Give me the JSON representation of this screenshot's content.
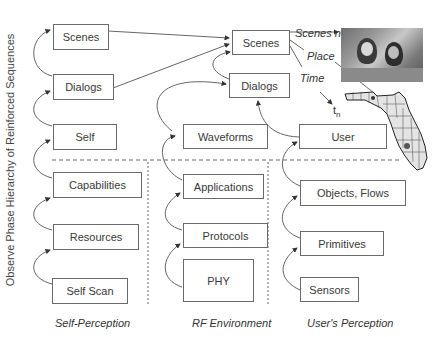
{
  "y_axis_label": "Observe Phase Hierarchy of Reinforced Sequences",
  "columns": [
    {
      "label": "Self-Perception",
      "boxes": [
        "Self Scan",
        "Resources",
        "Capabilities",
        "Self",
        "Dialogs",
        "Scenes"
      ]
    },
    {
      "label": "RF Environment",
      "boxes": [
        "PHY",
        "Protocols",
        "Applications",
        "Waveforms"
      ]
    },
    {
      "label": "User's Perception",
      "boxes": [
        "Sensors",
        "Primitives",
        "Objects, Flows",
        "User"
      ]
    }
  ],
  "shared": {
    "scenes": "Scenes",
    "dialogs": "Dialogs"
  },
  "annotations": {
    "scenes_n": "Scenes n",
    "place": "Place",
    "time": "Time",
    "t_n": "t",
    "t_n_sub": "n"
  },
  "images": {
    "photo": "photo-of-two-people",
    "map": "florida-county-map"
  }
}
